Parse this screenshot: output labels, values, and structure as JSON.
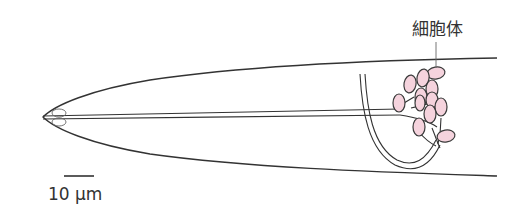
{
  "figure": {
    "labels": {
      "cell_body": "細胞体",
      "scale": "10 μm"
    },
    "colors": {
      "soma_fill": "#f5d3dd",
      "line": "#333333",
      "background": "#ffffff"
    },
    "scale_bar": {
      "length_um": 10
    }
  }
}
